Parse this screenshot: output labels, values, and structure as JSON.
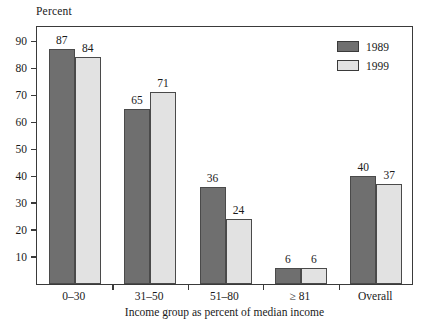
{
  "chart_data": {
    "type": "bar",
    "title": "",
    "subtitle": "",
    "categories": [
      "0–30",
      "31–50",
      "51–80",
      "≥ 81",
      "Overall"
    ],
    "series": [
      {
        "name": "1989",
        "color": "#6f6f6f",
        "values": [
          87,
          65,
          36,
          6,
          40
        ]
      },
      {
        "name": "1999",
        "color": "#e2e2e2",
        "values": [
          84,
          71,
          24,
          6,
          37
        ]
      }
    ],
    "xlabel": "Income group as percent of median income",
    "ylabel": "Percent",
    "ylim": [
      0,
      96
    ],
    "yticks": [
      10,
      20,
      30,
      40,
      50,
      60,
      70,
      80,
      90
    ],
    "grid": false,
    "legend_position": "top-right"
  },
  "legend": {
    "entries": [
      {
        "label": "1989"
      },
      {
        "label": "1999"
      }
    ]
  },
  "axes": {
    "y_caption": "Percent",
    "x_title": "Income group as percent of median income"
  }
}
